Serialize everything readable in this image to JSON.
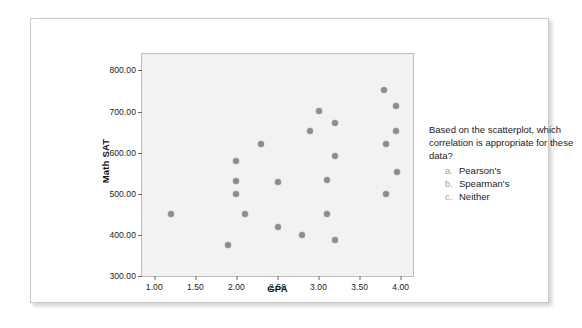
{
  "chart_data": {
    "type": "scatter",
    "title": "",
    "xlabel": "GPA",
    "ylabel": "Math SAT",
    "xlim": [
      0.85,
      4.15
    ],
    "ylim": [
      300,
      840
    ],
    "grid": false,
    "legend": "none",
    "xticks": [
      "1.00",
      "1.50",
      "2.00",
      "2.50",
      "3.00",
      "3.50",
      "4.00"
    ],
    "xtick_values": [
      1.0,
      1.5,
      2.0,
      2.5,
      3.0,
      3.5,
      4.0
    ],
    "yticks": [
      "300.00",
      "400.00",
      "500.00",
      "600.00",
      "700.00",
      "800.00"
    ],
    "ytick_values": [
      300,
      400,
      500,
      600,
      700,
      800
    ],
    "point_color": "#8d8d8d",
    "plot_background": "#f2f2f2",
    "points": [
      {
        "x": 1.2,
        "y": 450
      },
      {
        "x": 1.9,
        "y": 375
      },
      {
        "x": 2.0,
        "y": 580
      },
      {
        "x": 2.0,
        "y": 530
      },
      {
        "x": 2.0,
        "y": 500
      },
      {
        "x": 2.1,
        "y": 450
      },
      {
        "x": 2.3,
        "y": 620
      },
      {
        "x": 2.5,
        "y": 528
      },
      {
        "x": 2.5,
        "y": 418
      },
      {
        "x": 2.8,
        "y": 400
      },
      {
        "x": 2.9,
        "y": 652
      },
      {
        "x": 3.0,
        "y": 702
      },
      {
        "x": 3.1,
        "y": 534
      },
      {
        "x": 3.1,
        "y": 450
      },
      {
        "x": 3.2,
        "y": 672
      },
      {
        "x": 3.2,
        "y": 592
      },
      {
        "x": 3.2,
        "y": 388
      },
      {
        "x": 3.8,
        "y": 752
      },
      {
        "x": 3.82,
        "y": 620
      },
      {
        "x": 3.82,
        "y": 500
      },
      {
        "x": 3.94,
        "y": 714
      },
      {
        "x": 3.94,
        "y": 652
      },
      {
        "x": 3.96,
        "y": 552
      }
    ]
  },
  "question": {
    "prompt": "Based on the scatterplot, which correlation is appropriate for these data?",
    "options": [
      {
        "letter": "a.",
        "text": "Pearson's"
      },
      {
        "letter": "b.",
        "text": "Spearman's"
      },
      {
        "letter": "c.",
        "text": "Neither"
      }
    ]
  }
}
